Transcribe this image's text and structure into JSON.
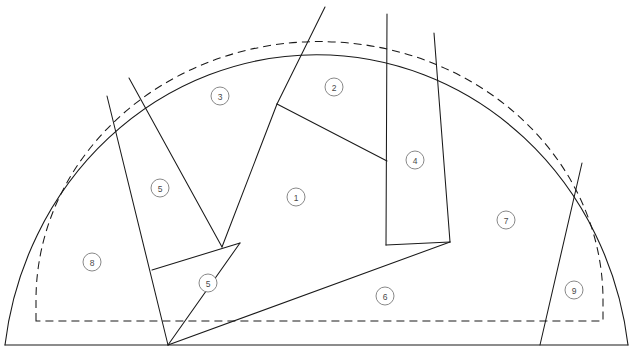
{
  "diagram": {
    "type": "technical-line-drawing",
    "canvas": {
      "width": 633,
      "height": 355
    },
    "colors": {
      "background": "#ffffff",
      "line": "#1a1a1a",
      "label_stroke": "#7a7a7a",
      "label_text": "#4a4a4a"
    },
    "baseline": {
      "y": 345,
      "x_start": 5,
      "x_end": 628
    },
    "outer_arc": {
      "style": "solid",
      "path": "M 5 345 A 314 332 0 0 1 628 345"
    },
    "inner_arc": {
      "style": "dashed",
      "path": "M 36 321 L 36 300 A 283 258 0 0 1 603 300 L 603 321 Z"
    },
    "regions": [
      {
        "id": "1",
        "label": "1",
        "cx": 296,
        "cy": 197
      },
      {
        "id": "2",
        "label": "2",
        "cx": 334,
        "cy": 87
      },
      {
        "id": "3",
        "label": "3",
        "cx": 220,
        "cy": 96
      },
      {
        "id": "4",
        "label": "4",
        "cx": 415,
        "cy": 160
      },
      {
        "id": "5a",
        "label": "5",
        "cx": 160,
        "cy": 188
      },
      {
        "id": "5b",
        "label": "5",
        "cx": 208,
        "cy": 283
      },
      {
        "id": "6",
        "label": "6",
        "cx": 385,
        "cy": 296
      },
      {
        "id": "7",
        "label": "7",
        "cx": 506,
        "cy": 220
      },
      {
        "id": "8",
        "label": "8",
        "cx": 92,
        "cy": 262
      },
      {
        "id": "9",
        "label": "9",
        "cx": 574,
        "cy": 290
      }
    ],
    "dividers": [
      {
        "name": "divider-8-5a",
        "points": "107,96 168,345"
      },
      {
        "name": "divider-5a-3",
        "points": "129,78 222,247"
      },
      {
        "name": "divider-3-1",
        "points": "222,247 277,104"
      },
      {
        "name": "divider-1-2",
        "points": "277,104 325,7"
      },
      {
        "name": "divider-1-top",
        "points": "277,104 387,161"
      },
      {
        "name": "divider-2-4",
        "points": "387,14 386,245"
      },
      {
        "name": "divider-4-7",
        "points": "434,33 450,242"
      },
      {
        "name": "divider-7-9",
        "points": "582,163 540,345"
      },
      {
        "name": "divider-5a-5b",
        "points": "152,270 240,243"
      },
      {
        "name": "divider-1-5b",
        "points": "240,243 168,345"
      },
      {
        "name": "divider-6-upper",
        "points": "168,345 450,242"
      },
      {
        "name": "divider-1-6-right",
        "points": "386,245 450,242"
      }
    ],
    "label_radius": 9
  }
}
